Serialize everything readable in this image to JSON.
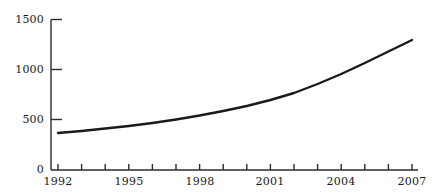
{
  "chart_data": {
    "type": "line",
    "title": "",
    "subtitle": "",
    "xlabel": "",
    "ylabel": "",
    "xlim": [
      1992,
      2007
    ],
    "ylim": [
      0,
      1500
    ],
    "grid": false,
    "legend": null,
    "legend_position": "none",
    "line_color": "#1a1a1a",
    "line_width_px": 2.4,
    "axis_color": "#2b2b2b",
    "background": "#ffffff",
    "x_tick_values": [
      1992,
      1993,
      1994,
      1995,
      1996,
      1997,
      1998,
      1999,
      2000,
      2001,
      2002,
      2003,
      2004,
      2005,
      2006,
      2007
    ],
    "x_tick_labels": [
      "1992",
      "",
      "",
      "1995",
      "",
      "",
      "1998",
      "",
      "",
      "2001",
      "",
      "",
      "2004",
      "",
      "",
      "2007"
    ],
    "x_labeled_ticks": [
      "1992",
      "1995",
      "1998",
      "2001",
      "2004",
      "2007"
    ],
    "y_tick_values": [
      0,
      500,
      1000,
      1500
    ],
    "y_tick_labels": [
      "0",
      "500",
      "1000",
      "1500"
    ],
    "series": [
      {
        "name": "value",
        "x": [
          1992,
          1993,
          1994,
          1995,
          1996,
          1997,
          1998,
          1999,
          2000,
          2001,
          2002,
          2003,
          2004,
          2005,
          2006,
          2007
        ],
        "values": [
          370,
          390,
          415,
          440,
          470,
          505,
          545,
          590,
          640,
          700,
          770,
          860,
          960,
          1070,
          1185,
          1300
        ]
      }
    ]
  },
  "labels": {
    "y": {
      "t0": "0",
      "t500": "500",
      "t1000": "1000",
      "t1500": "1500"
    },
    "x": {
      "t1992": "1992",
      "t1995": "1995",
      "t1998": "1998",
      "t2001": "2001",
      "t2004": "2004",
      "t2007": "2007"
    }
  },
  "accessible_title": "Line chart showing steady exponential growth from about 370 in 1992 to about 1300 in 2007"
}
